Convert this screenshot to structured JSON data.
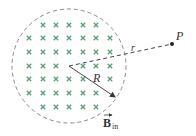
{
  "figure": {
    "colors": {
      "boundary": "#8a8a8a",
      "field_marks": "#5f9f7a",
      "lines": "#444444",
      "point": "#222222",
      "text": "#333333"
    },
    "region": {
      "center": [
        69,
        66
      ],
      "radius": 57,
      "boundary_style": "dashed"
    },
    "field_marks": {
      "symbol": "×",
      "meaning": "magnetic field into page",
      "rows": [
        {
          "y": 25,
          "xs": [
            43,
            56,
            69,
            83,
            96
          ]
        },
        {
          "y": 38,
          "xs": [
            29,
            43,
            56,
            69,
            83,
            96,
            110
          ]
        },
        {
          "y": 52,
          "xs": [
            29,
            43,
            56,
            69,
            83,
            96,
            110
          ]
        },
        {
          "y": 66,
          "xs": [
            29,
            43,
            56,
            83,
            96,
            110
          ]
        },
        {
          "y": 79,
          "xs": [
            29,
            43,
            56,
            69,
            83,
            110
          ]
        },
        {
          "y": 93,
          "xs": [
            29,
            43,
            56,
            69,
            83,
            96
          ]
        },
        {
          "y": 107,
          "xs": [
            43,
            56,
            69,
            83,
            96
          ]
        }
      ]
    },
    "point_P": {
      "label": "P",
      "position": [
        172,
        44
      ]
    },
    "labels": {
      "r": "r",
      "R": "R",
      "B_main": "B",
      "B_sub": "in",
      "P": "P"
    }
  }
}
